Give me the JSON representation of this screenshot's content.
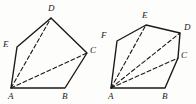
{
  "image": {
    "title": "Two polygon triangulation diagrams",
    "background_color": "#fdfdfb",
    "stroke_color": "#1a1a1a",
    "width": 196,
    "height": 104
  },
  "figures": [
    {
      "id": "left-figure",
      "name": "pentagon-ABCDE",
      "vertex_count": 5,
      "outline_label": "ABCDE",
      "vertices": [
        {
          "label": "A",
          "x": 11,
          "y": 88,
          "label_x": 8,
          "label_y": 92
        },
        {
          "label": "B",
          "x": 65,
          "y": 88,
          "label_x": 62,
          "label_y": 92
        },
        {
          "label": "C",
          "x": 87,
          "y": 53,
          "label_x": 90,
          "label_y": 47
        },
        {
          "label": "D",
          "x": 51,
          "y": 18,
          "label_x": 48,
          "label_y": 4
        },
        {
          "label": "E",
          "x": 17,
          "y": 47,
          "label_x": 3,
          "label_y": 41
        }
      ],
      "outline_path": "M 11 88 L 65 88 L 87 53 L 51 18 L 17 47 Z",
      "diagonals": [
        {
          "from": "A",
          "to": "C",
          "path": "M 11 88 L 87 53",
          "style": "dashed"
        },
        {
          "from": "A",
          "to": "D",
          "path": "M 11 88 L 51 18",
          "style": "dashed"
        }
      ],
      "diagonal_count": 2,
      "triangle_count": 3
    },
    {
      "id": "right-figure",
      "name": "hexagon-ABCDEF",
      "vertex_count": 6,
      "outline_label": "ABCDEF",
      "vertices": [
        {
          "label": "A",
          "x": 111,
          "y": 88,
          "label_x": 108,
          "label_y": 92
        },
        {
          "label": "B",
          "x": 165,
          "y": 88,
          "label_x": 162,
          "label_y": 92
        },
        {
          "label": "C",
          "x": 178,
          "y": 58,
          "label_x": 181,
          "label_y": 52
        },
        {
          "label": "D",
          "x": 180,
          "y": 33,
          "label_x": 184,
          "label_y": 24
        },
        {
          "label": "E",
          "x": 146,
          "y": 25,
          "label_x": 142,
          "label_y": 12
        },
        {
          "label": "F",
          "x": 117,
          "y": 41,
          "label_x": 101,
          "label_y": 32
        }
      ],
      "outline_path": "M 111 88 L 165 88 L 178 58 L 180 33 L 146 25 L 117 41 Z",
      "diagonals": [
        {
          "from": "A",
          "to": "C",
          "path": "M 111 88 L 178 58",
          "style": "dashed"
        },
        {
          "from": "A",
          "to": "D",
          "path": "M 111 88 L 180 33",
          "style": "dashed"
        },
        {
          "from": "A",
          "to": "E",
          "path": "M 111 88 L 146 25",
          "style": "dashed"
        }
      ],
      "diagonal_count": 3,
      "triangle_count": 4
    }
  ]
}
